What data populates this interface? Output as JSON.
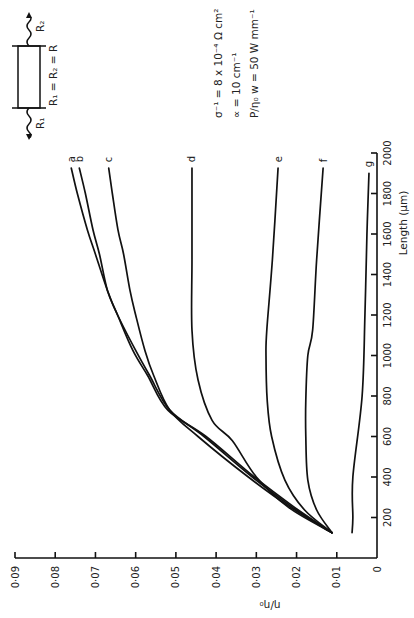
{
  "chart_data": {
    "type": "line",
    "orientation": "rotated 90 degrees counter-clockwise",
    "title": "",
    "xlabel": "Length (µm)",
    "ylabel": "η/η₀",
    "xlim": [
      0,
      2000
    ],
    "ylim": [
      0,
      0.09
    ],
    "grid": false,
    "xticks": [
      200,
      400,
      600,
      800,
      1000,
      1200,
      1400,
      1600,
      1800,
      2000
    ],
    "xtick_labels": [
      "200",
      "400",
      "600",
      "800",
      "1000",
      "1200",
      "1400",
      "1600",
      "1800",
      "2000"
    ],
    "yticks": [
      0,
      0.01,
      0.02,
      0.03,
      0.04,
      0.05,
      0.06,
      0.07,
      0.08,
      0.09
    ],
    "ytick_labels": [
      "0",
      "0·01",
      "0·02",
      "0·03",
      "0·04",
      "0·05",
      "0·06",
      "0·07",
      "0·08",
      "0·09"
    ],
    "series": [
      {
        "name": "a",
        "x": [
          125,
          250,
          400,
          600,
          730,
          900,
          1025,
          1200,
          1320,
          1500,
          1620,
          1800,
          1925
        ],
        "y": [
          0.0112,
          0.021,
          0.031,
          0.043,
          0.0515,
          0.0565,
          0.06,
          0.0645,
          0.067,
          0.07,
          0.072,
          0.0745,
          0.076
        ]
      },
      {
        "name": "b",
        "x": [
          125,
          250,
          400,
          600,
          730,
          900,
          1025,
          1200,
          1320,
          1500,
          1620,
          1800,
          1925
        ],
        "y": [
          0.0112,
          0.0205,
          0.0305,
          0.0425,
          0.052,
          0.057,
          0.0607,
          0.0645,
          0.067,
          0.069,
          0.0706,
          0.0725,
          0.074
        ]
      },
      {
        "name": "c",
        "x": [
          125,
          250,
          400,
          600,
          730,
          900,
          1025,
          1200,
          1320,
          1500,
          1620,
          1800,
          1925
        ],
        "y": [
          0.0112,
          0.0215,
          0.032,
          0.0445,
          0.0515,
          0.0555,
          0.0577,
          0.06,
          0.0614,
          0.063,
          0.0644,
          0.0658,
          0.0667
        ]
      },
      {
        "name": "d",
        "x": [
          125,
          250,
          400,
          580,
          680,
          880,
          1125,
          1475,
          1925
        ],
        "y": [
          0.0112,
          0.022,
          0.03,
          0.036,
          0.041,
          0.0445,
          0.046,
          0.046,
          0.046
        ]
      },
      {
        "name": "e",
        "x": [
          125,
          237,
          385,
          600,
          780,
          1000,
          1125,
          1475,
          1925
        ],
        "y": [
          0.0112,
          0.018,
          0.0229,
          0.0262,
          0.0273,
          0.0276,
          0.0274,
          0.026,
          0.0246
        ]
      },
      {
        "name": "f",
        "x": [
          125,
          237,
          385,
          600,
          780,
          1000,
          1125,
          1475,
          1925
        ],
        "y": [
          0.0112,
          0.015,
          0.0172,
          0.0177,
          0.0177,
          0.0172,
          0.016,
          0.015,
          0.0134
        ]
      },
      {
        "name": "g",
        "x": [
          125,
          200,
          400,
          800,
          1200,
          1600,
          1900
        ],
        "y": [
          0.0062,
          0.006,
          0.006,
          0.0037,
          0.003,
          0.0025,
          0.002
        ]
      }
    ]
  },
  "annotations": {
    "params": [
      "σ⁻¹ = 8 x 10⁻⁴ Ω cm²",
      "∝ = 10 cm⁻¹",
      "P/η₀ w = 50 W mm⁻¹"
    ],
    "diagram": {
      "left_label": "R₁",
      "right_label": "R₂",
      "equation": "R₁ = R₂ = R"
    }
  }
}
